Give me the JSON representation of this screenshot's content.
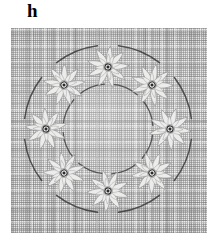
{
  "figure": {
    "panel_label": "h",
    "caption": ""
  },
  "panel": {
    "name": "textile-panel",
    "x": 11,
    "y": 28,
    "width": 196,
    "height": 205,
    "background_color": "#e3e3e3",
    "weave_thread_color": "#787878",
    "weave_highlight_color": "#ffffff"
  },
  "wreath": {
    "name": "floral-wreath",
    "center_x": 97,
    "center_y": 101,
    "rosette_count": 8,
    "rosette_ring_radius": 62,
    "outer_arc_radius": 84,
    "inner_arc_radius": 45,
    "petal_fill_color": "#ececeb",
    "petal_outline_color": "#9a9a9a",
    "arc_color": "#3a3a3a",
    "rosette_center_color": "#2b2b2b",
    "rosettes": [
      {
        "id": "rosette-top",
        "angle_deg": 270,
        "cx": 97,
        "cy": 39,
        "petals": 9
      },
      {
        "id": "rosette-top-right",
        "angle_deg": 315,
        "cx": 141,
        "cy": 57,
        "petals": 9
      },
      {
        "id": "rosette-right",
        "angle_deg": 0,
        "cx": 159,
        "cy": 101,
        "petals": 9
      },
      {
        "id": "rosette-bottom-right",
        "angle_deg": 45,
        "cx": 141,
        "cy": 145,
        "petals": 9
      },
      {
        "id": "rosette-bottom",
        "angle_deg": 90,
        "cx": 97,
        "cy": 163,
        "petals": 9
      },
      {
        "id": "rosette-bottom-left",
        "angle_deg": 135,
        "cx": 53,
        "cy": 145,
        "petals": 9
      },
      {
        "id": "rosette-left",
        "angle_deg": 180,
        "cx": 35,
        "cy": 101,
        "petals": 9
      },
      {
        "id": "rosette-top-left",
        "angle_deg": 225,
        "cx": 53,
        "cy": 57,
        "petals": 9
      }
    ]
  }
}
